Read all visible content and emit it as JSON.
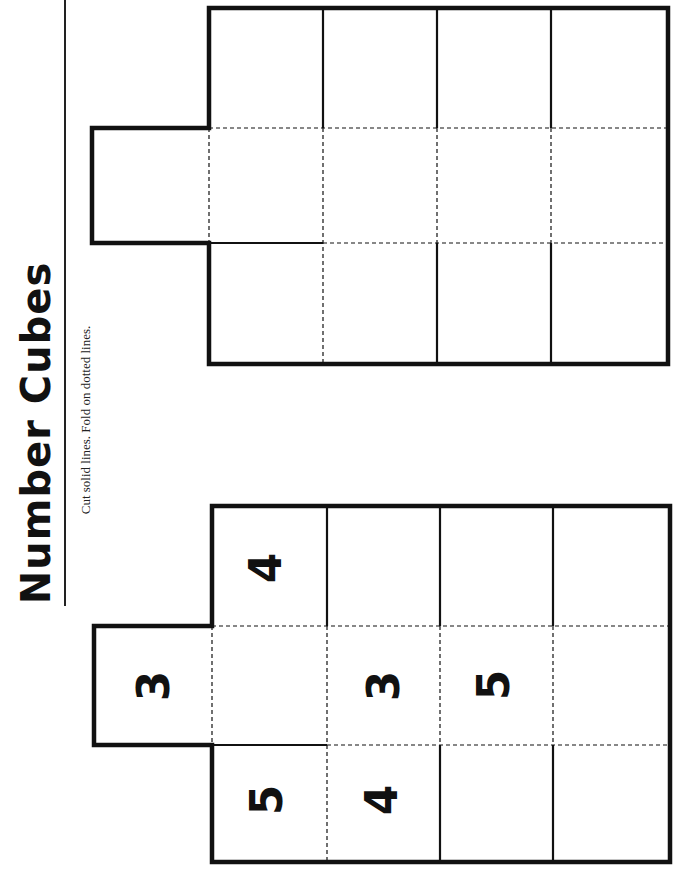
{
  "header": {
    "title": "Number Cubes",
    "instructions": "Cut solid lines. Fold on dotted lines."
  },
  "nets": [
    {
      "name": "blank-net",
      "faces": [
        {
          "position": "tab",
          "value": ""
        },
        {
          "position": "row1-col1",
          "value": ""
        },
        {
          "position": "row1-col2",
          "value": ""
        },
        {
          "position": "row1-col3",
          "value": ""
        },
        {
          "position": "row1-col4",
          "value": ""
        },
        {
          "position": "row2-col1",
          "value": ""
        },
        {
          "position": "row2-col2",
          "value": ""
        },
        {
          "position": "row2-col3",
          "value": ""
        },
        {
          "position": "row2-col4",
          "value": ""
        },
        {
          "position": "row3-col1",
          "value": ""
        },
        {
          "position": "row3-col2",
          "value": ""
        },
        {
          "position": "row3-col3",
          "value": ""
        },
        {
          "position": "row3-col4",
          "value": ""
        }
      ]
    },
    {
      "name": "numbered-net",
      "faces": [
        {
          "position": "tab",
          "value": "3"
        },
        {
          "position": "row1-col1",
          "value": "4"
        },
        {
          "position": "row1-col2",
          "value": ""
        },
        {
          "position": "row1-col3",
          "value": ""
        },
        {
          "position": "row1-col4",
          "value": ""
        },
        {
          "position": "row2-col1",
          "value": ""
        },
        {
          "position": "row2-col2",
          "value": "3"
        },
        {
          "position": "row2-col3",
          "value": "5"
        },
        {
          "position": "row2-col4",
          "value": ""
        },
        {
          "position": "row3-col1",
          "value": "5"
        },
        {
          "position": "row3-col2",
          "value": "4"
        },
        {
          "position": "row3-col3",
          "value": ""
        },
        {
          "position": "row3-col4",
          "value": ""
        }
      ]
    }
  ],
  "colors": {
    "line": "#111111",
    "background": "#ffffff"
  }
}
